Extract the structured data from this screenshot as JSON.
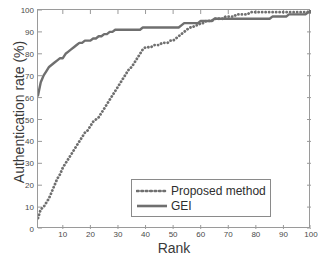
{
  "chart_data": {
    "type": "line",
    "title": "",
    "xlabel": "Rank",
    "ylabel": "Authentication rate (%)",
    "xlim": [
      1,
      100
    ],
    "ylim": [
      0,
      100
    ],
    "xticks": [
      10,
      20,
      30,
      40,
      50,
      60,
      70,
      80,
      90,
      100
    ],
    "yticks": [
      0,
      10,
      20,
      30,
      40,
      50,
      60,
      70,
      80,
      90,
      100
    ],
    "grid": false,
    "legend_position": "lower right",
    "x": [
      1,
      2,
      3,
      4,
      5,
      6,
      7,
      8,
      9,
      10,
      11,
      12,
      13,
      14,
      15,
      16,
      17,
      18,
      19,
      20,
      21,
      22,
      23,
      24,
      25,
      26,
      27,
      28,
      29,
      30,
      31,
      32,
      33,
      34,
      35,
      36,
      37,
      38,
      39,
      40,
      41,
      42,
      43,
      44,
      45,
      46,
      47,
      48,
      49,
      50,
      51,
      52,
      53,
      54,
      55,
      56,
      57,
      58,
      59,
      60,
      61,
      62,
      63,
      64,
      65,
      66,
      67,
      68,
      69,
      70,
      71,
      72,
      73,
      74,
      75,
      76,
      77,
      78,
      79,
      80,
      81,
      82,
      83,
      84,
      85,
      86,
      87,
      88,
      89,
      90,
      91,
      92,
      93,
      94,
      95,
      96,
      97,
      98,
      99,
      100
    ],
    "series": [
      {
        "name": "Proposed method",
        "style": "dotted",
        "color": "#6f6f6f",
        "values": [
          5,
          9,
          10,
          12,
          14,
          17,
          20,
          23,
          25,
          28,
          30,
          32,
          34,
          36,
          38,
          40,
          42,
          44,
          45,
          47,
          49,
          50,
          51,
          53,
          55,
          57,
          59,
          61,
          63,
          65,
          67,
          69,
          71,
          73,
          74,
          76,
          78,
          80,
          82,
          83,
          83,
          83,
          84,
          84,
          84,
          85,
          85,
          85,
          86,
          86,
          87,
          88,
          89,
          90,
          91,
          92,
          92,
          93,
          93,
          94,
          94,
          95,
          95,
          95,
          96,
          96,
          96,
          96,
          97,
          97,
          97,
          97,
          98,
          98,
          98,
          98,
          98,
          99,
          99,
          99,
          99,
          99,
          99,
          99,
          99,
          99,
          99,
          99,
          99,
          99,
          99,
          99,
          99,
          99,
          99,
          99,
          99,
          99,
          99,
          100
        ]
      },
      {
        "name": "GEI",
        "style": "solid",
        "color": "#6f6f6f",
        "values": [
          61,
          67,
          70,
          72,
          74,
          75,
          76,
          77,
          78,
          78,
          80,
          81,
          82,
          83,
          84,
          85,
          85,
          86,
          86,
          86,
          87,
          87,
          88,
          88,
          89,
          89,
          90,
          90,
          91,
          91,
          91,
          91,
          91,
          91,
          91,
          91,
          91,
          91,
          92,
          92,
          92,
          92,
          92,
          92,
          92,
          92,
          92,
          92,
          92,
          92,
          92,
          92,
          93,
          94,
          94,
          94,
          94,
          94,
          94,
          95,
          95,
          95,
          95,
          95,
          96,
          96,
          96,
          96,
          96,
          96,
          96,
          96,
          96,
          96,
          96,
          96,
          96,
          96,
          96,
          96,
          96,
          96,
          96,
          96,
          96,
          97,
          97,
          97,
          97,
          97,
          97,
          98,
          98,
          98,
          98,
          98,
          98,
          98,
          99,
          99
        ]
      }
    ]
  },
  "legend": {
    "items": [
      {
        "label": "Proposed method"
      },
      {
        "label": "GEI"
      }
    ]
  },
  "axes": {
    "y_tick_labels": [
      "0",
      "10",
      "20",
      "30",
      "40",
      "50",
      "60",
      "70",
      "80",
      "90",
      "100"
    ],
    "x_tick_labels": [
      "10",
      "20",
      "30",
      "40",
      "50",
      "60",
      "70",
      "80",
      "90",
      "100"
    ]
  }
}
